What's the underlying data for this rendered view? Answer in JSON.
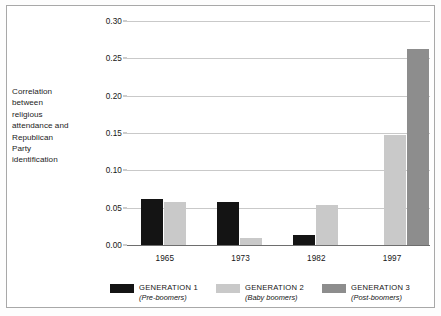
{
  "axis_caption": {
    "lines": [
      "Correlation",
      "between",
      "religious",
      "attendance and",
      "Republican",
      "Party",
      "identification"
    ]
  },
  "legend": {
    "items": [
      {
        "title": "GENERATION 1",
        "subtitle": "(Pre-boomers)",
        "color": "#141414",
        "swatch_name": "legend-swatch-generation-1"
      },
      {
        "title": "GENERATION 2",
        "subtitle": "(Baby boomers)",
        "color": "#c9c9c9",
        "swatch_name": "legend-swatch-generation-2"
      },
      {
        "title": "GENERATION 3",
        "subtitle": "(Post-boomers)",
        "color": "#8d8d8d",
        "swatch_name": "legend-swatch-generation-3"
      }
    ]
  },
  "chart_data": {
    "type": "bar",
    "title": "",
    "xlabel": "",
    "ylabel": "Correlation between religious attendance and Republican Party identification",
    "categories": [
      "1965",
      "1973",
      "1982",
      "1997"
    ],
    "series": [
      {
        "name": "GENERATION 1",
        "color": "#141414",
        "values": [
          0.062,
          0.057,
          0.013,
          null
        ]
      },
      {
        "name": "GENERATION 2",
        "color": "#c9c9c9",
        "values": [
          0.058,
          0.01,
          0.054,
          0.148
        ]
      },
      {
        "name": "GENERATION 3",
        "color": "#8d8d8d",
        "values": [
          null,
          null,
          null,
          0.262
        ]
      }
    ],
    "ylim": [
      0.0,
      0.3
    ],
    "ytick_labels": [
      "0.00",
      "0.05",
      "0.10",
      "0.15",
      "0.20",
      "0.25",
      "0.30"
    ],
    "ytick_values": [
      0.0,
      0.05,
      0.1,
      0.15,
      0.2,
      0.25,
      0.3
    ],
    "grid": true,
    "legend_position": "bottom"
  }
}
